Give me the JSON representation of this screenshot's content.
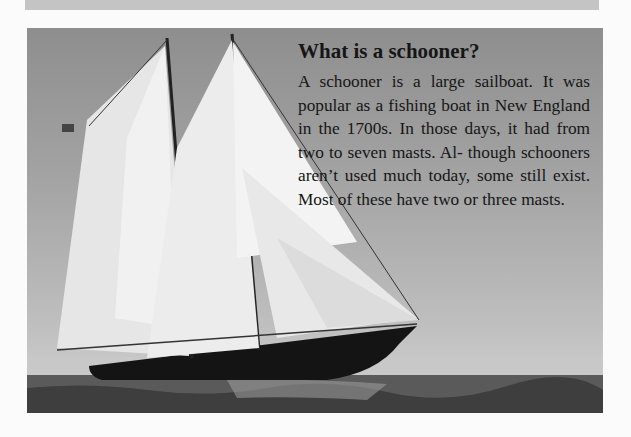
{
  "article": {
    "title": "What is a schooner?",
    "body": "A schooner is a large sailboat. It was popular as a fishing boat in New England in the 1700s. In those days, it had from two to seven masts. Al- though schooners aren’t used much today, some still exist. Most of these have two or three masts."
  },
  "photo": {
    "subject": "schooner-sailing-at-sea"
  }
}
